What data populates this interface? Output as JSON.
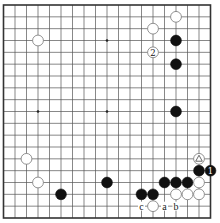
{
  "diagram": {
    "type": "go-board",
    "size": 19,
    "colors": {
      "black": "#111111",
      "white": "#ffffff",
      "line": "#555555"
    },
    "star_points": [
      [
        3,
        3
      ],
      [
        3,
        9
      ],
      [
        3,
        15
      ],
      [
        9,
        3
      ],
      [
        9,
        9
      ],
      [
        9,
        15
      ],
      [
        15,
        3
      ],
      [
        15,
        9
      ],
      [
        15,
        15
      ]
    ],
    "stones": [
      {
        "color": "white",
        "col": 3,
        "row": 3
      },
      {
        "color": "white",
        "col": 15,
        "row": 1
      },
      {
        "color": "white",
        "col": 13,
        "row": 2
      },
      {
        "color": "black",
        "col": 15,
        "row": 3
      },
      {
        "color": "white",
        "col": 13,
        "row": 4,
        "label": "2"
      },
      {
        "color": "black",
        "col": 15,
        "row": 5
      },
      {
        "color": "black",
        "col": 15,
        "row": 9
      },
      {
        "color": "white",
        "col": 2,
        "row": 13
      },
      {
        "color": "white",
        "col": 3,
        "row": 15
      },
      {
        "color": "black",
        "col": 5,
        "row": 16
      },
      {
        "color": "black",
        "col": 9,
        "row": 15
      },
      {
        "color": "white",
        "col": 17,
        "row": 13,
        "mark": "triangle"
      },
      {
        "color": "black",
        "col": 17,
        "row": 14
      },
      {
        "color": "black",
        "col": 18,
        "row": 14,
        "label": "1"
      },
      {
        "color": "black",
        "col": 14,
        "row": 15
      },
      {
        "color": "black",
        "col": 15,
        "row": 15
      },
      {
        "color": "black",
        "col": 16,
        "row": 15
      },
      {
        "color": "white",
        "col": 17,
        "row": 15
      },
      {
        "color": "black",
        "col": 12,
        "row": 16
      },
      {
        "color": "black",
        "col": 13,
        "row": 16
      },
      {
        "color": "white",
        "col": 15,
        "row": 16
      },
      {
        "color": "white",
        "col": 16,
        "row": 16
      },
      {
        "color": "white",
        "col": 17,
        "row": 16
      },
      {
        "color": "white",
        "col": 13,
        "row": 17
      }
    ],
    "labels": [
      {
        "text": "c",
        "col": 12,
        "row": 17
      },
      {
        "text": "a",
        "col": 14,
        "row": 17
      },
      {
        "text": "b",
        "col": 15,
        "row": 17
      }
    ]
  }
}
